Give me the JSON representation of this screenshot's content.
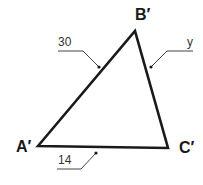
{
  "diagram": {
    "type": "triangle",
    "vertices": {
      "A": {
        "label": "A′",
        "x": 38,
        "y": 146
      },
      "B": {
        "label": "B′",
        "x": 135,
        "y": 31
      },
      "C": {
        "label": "C′",
        "x": 168,
        "y": 148
      }
    },
    "sides": {
      "AB": {
        "label": "30"
      },
      "BC": {
        "label": "y"
      },
      "AC": {
        "label": "14"
      }
    },
    "colors": {
      "stroke": "#1a1a1a",
      "leader": "#444444"
    }
  }
}
